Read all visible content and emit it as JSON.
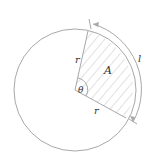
{
  "diagram": {
    "labels": {
      "radius_top": "r",
      "radius_bottom": "r",
      "area": "A",
      "angle": "θ",
      "arc_length": "l"
    },
    "colors": {
      "stroke": "#a8a8a8",
      "hatch": "#c4c4c4",
      "text": "#333333",
      "background": "#ffffff"
    }
  }
}
